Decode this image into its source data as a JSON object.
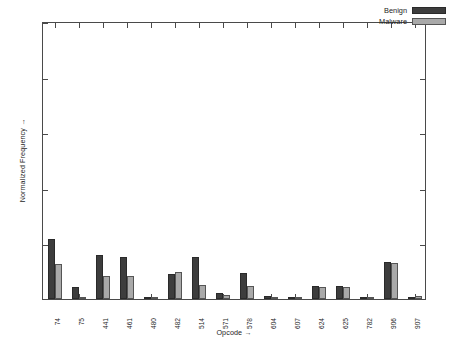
{
  "chart_data": {
    "type": "bar",
    "title": "",
    "xlabel": "Opcode →",
    "ylabel": "Normalized Frequency →",
    "categories": [
      "74",
      "75",
      "441",
      "461",
      "480",
      "482",
      "514",
      "571",
      "578",
      "604",
      "607",
      "624",
      "625",
      "782",
      "906",
      "907"
    ],
    "series": [
      {
        "name": "Benign",
        "color": "#3d3d3d",
        "values": [
          0.215,
          0.045,
          0.16,
          0.152,
          0.008,
          0.09,
          0.152,
          0.022,
          0.092,
          0.01,
          0.006,
          0.046,
          0.048,
          0.008,
          0.132,
          0.004
        ]
      },
      {
        "name": "Malware",
        "color": "#a9a9a9",
        "values": [
          0.125,
          0.002,
          0.082,
          0.082,
          0.004,
          0.098,
          0.052,
          0.014,
          0.046,
          0.002,
          0.002,
          0.042,
          0.044,
          0.003,
          0.128,
          0.01
        ]
      }
    ],
    "ylim": [
      0,
      1
    ],
    "yticks": [
      0,
      0.2,
      0.4,
      0.6,
      0.8,
      1
    ],
    "ytick_labels": [
      "0",
      "0.2",
      "0.4",
      "0.6",
      "0.8",
      "1"
    ],
    "grid": false,
    "legend_position": "top-right",
    "xtick_rotation": 90
  },
  "legend": {
    "entries": [
      {
        "label": "Benign"
      },
      {
        "label": "Malware"
      }
    ]
  },
  "axes": {
    "y_title": "Normalized Frequency →",
    "x_title": "Opcode →"
  }
}
